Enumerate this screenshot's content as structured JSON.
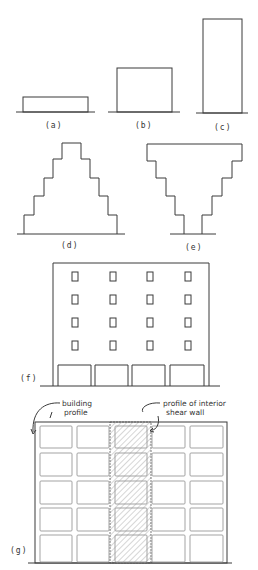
{
  "figure": {
    "panels": [
      {
        "id": "a",
        "label": "(a)",
        "description": "low wide rectangular building profile"
      },
      {
        "id": "b",
        "label": "(b)",
        "description": "medium height rectangular building profile"
      },
      {
        "id": "c",
        "label": "(c)",
        "description": "tall narrow rectangular building profile"
      },
      {
        "id": "d",
        "label": "(d)",
        "description": "stepped pyramid profile, narrowing upward"
      },
      {
        "id": "e",
        "label": "(e)",
        "description": "inverted stepped profile, widening upward"
      },
      {
        "id": "f",
        "label": "(f)",
        "description": "building elevation with 4x4 windows above soft open ground story"
      },
      {
        "id": "g",
        "label": "(g)",
        "description": "frame elevation with hatched interior shear wall bay"
      }
    ],
    "annotations": {
      "building_profile": "building profile",
      "building_profile_line1": "building",
      "building_profile_line2": "profile",
      "shear_wall_line1": "profile of interior",
      "shear_wall_line2": "shear wall"
    },
    "colors": {
      "line": "#3a3a3a",
      "hatch": "#888888",
      "background": "#ffffff"
    }
  }
}
